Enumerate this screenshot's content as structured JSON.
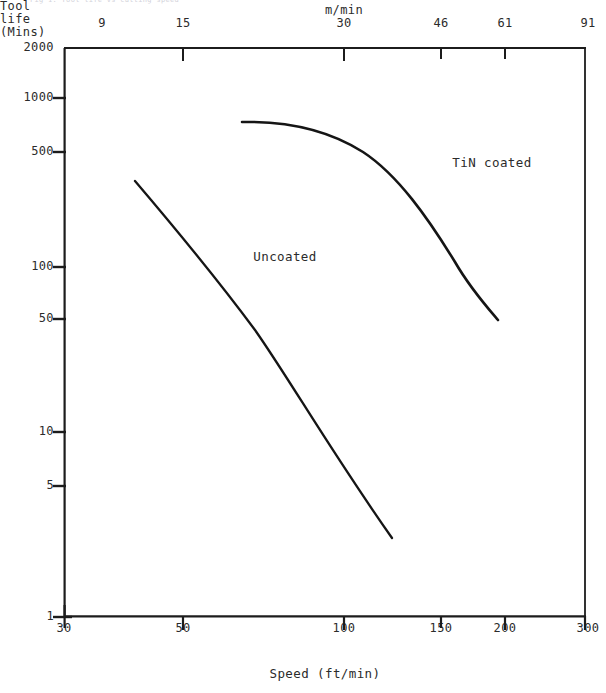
{
  "figure": {
    "top_caption": "Fig 1. Tool life vs cutting speed",
    "top_axis_unit": "m/min",
    "x_axis_title": "Speed (ft/min)",
    "y_axis_title_lines": [
      "Tool",
      "life",
      "(Mins)"
    ]
  },
  "chart_data": {
    "type": "line",
    "title": "",
    "xlabel": "Speed (ft/min)",
    "ylabel": "Tool life (Mins)",
    "xscale": "log",
    "yscale": "log",
    "xlim": [
      30,
      300
    ],
    "ylim": [
      1,
      2000
    ],
    "grid": false,
    "legend": "inline-annotations",
    "x_ticks": [
      {
        "value": 30,
        "label": "30",
        "px": 64
      },
      {
        "value": 50,
        "label": "50",
        "px": 183
      },
      {
        "value": 100,
        "label": "100",
        "px": 344
      },
      {
        "value": 150,
        "label": "150",
        "px": 441
      },
      {
        "value": 200,
        "label": "200",
        "px": 505
      },
      {
        "value": 300,
        "label": "300",
        "px": 586
      }
    ],
    "x_ticks_top": [
      {
        "value": 9,
        "label": "9",
        "px": 102
      },
      {
        "value": 15,
        "label": "15",
        "px": 183
      },
      {
        "value": 30,
        "label": "30",
        "px": 344
      },
      {
        "value": 46,
        "label": "46",
        "px": 441
      },
      {
        "value": 61,
        "label": "61",
        "px": 505
      },
      {
        "value": 91,
        "label": "91",
        "px": 586
      }
    ],
    "y_ticks": [
      {
        "value": 2000,
        "label": "2000",
        "px": 48
      },
      {
        "value": 1000,
        "label": "1000",
        "px": 98
      },
      {
        "value": 500,
        "label": "500",
        "px": 152
      },
      {
        "value": 100,
        "label": "100",
        "px": 267
      },
      {
        "value": 50,
        "label": "50",
        "px": 319
      },
      {
        "value": 10,
        "label": "10",
        "px": 432
      },
      {
        "value": 5,
        "label": "5",
        "px": 486
      },
      {
        "value": 1,
        "label": "1",
        "px": 617
      }
    ],
    "series": [
      {
        "name": "Uncoated",
        "annotation": "Uncoated",
        "annotation_px": {
          "x": 248,
          "y": 250
        },
        "points_speed_ft_min": [
          40,
          50,
          65,
          80,
          100,
          120,
          125
        ],
        "points_tool_life_min": [
          300,
          170,
          90,
          50,
          20,
          4.5,
          3.2
        ],
        "path_px": "M 135,181 C 175,228 215,276 255,330 C 290,380 330,450 392,538"
      },
      {
        "name": "TiN coated",
        "annotation": "TiN coated",
        "annotation_px": {
          "x": 447,
          "y": 156
        },
        "points_speed_ft_min": [
          67,
          80,
          100,
          120,
          140,
          160,
          180,
          200
        ],
        "points_tool_life_min": [
          780,
          770,
          720,
          620,
          460,
          280,
          140,
          53
        ],
        "path_px": "M 242,122 C 290,121 330,131 363,152 C 398,175 428,218 455,262 C 470,288 486,306 498,320"
      }
    ]
  }
}
